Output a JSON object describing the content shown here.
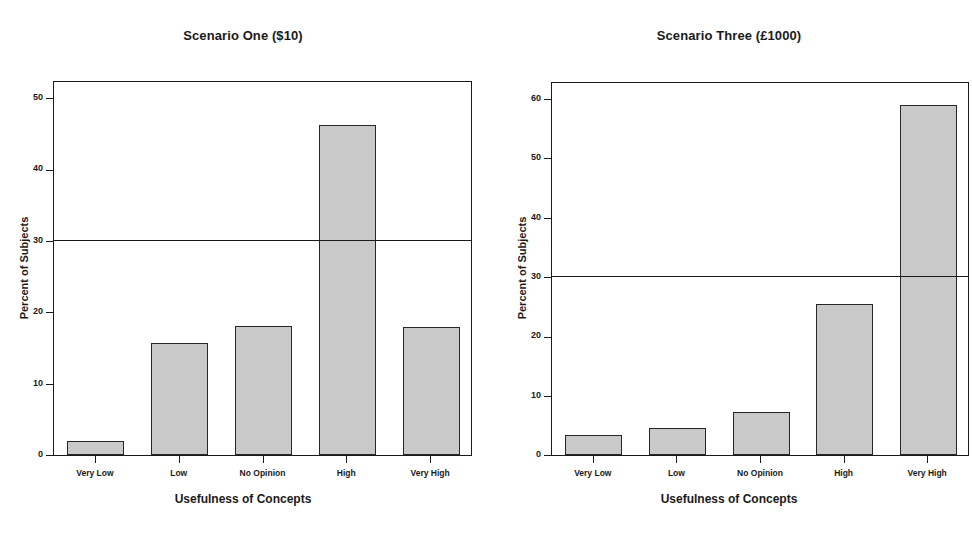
{
  "figure": {
    "background": "#ffffff",
    "bar_fill": "#c9c9c9",
    "bar_edge": "#262626",
    "axis_color": "#1a1a1a"
  },
  "panels": [
    {
      "id": "scenario-one",
      "title": "Scenario One ($10)",
      "xlabel": "Usefulness of Concepts",
      "ylabel": "Percent of Subjects"
    },
    {
      "id": "scenario-three",
      "title": "Scenario Three (£1000)",
      "xlabel": "Usefulness of Concepts",
      "ylabel": "Percent of Subjects"
    }
  ],
  "chart_data": [
    {
      "type": "bar",
      "title": "Scenario One ($10)",
      "xlabel": "Usefulness of Concepts",
      "ylabel": "Percent of Subjects",
      "categories": [
        "Very Low",
        "Low",
        "No Opinion",
        "High",
        "Very High"
      ],
      "values": [
        2.0,
        15.7,
        18.0,
        46.2,
        17.9
      ],
      "ylim": [
        0,
        52.5
      ],
      "yticks": [
        0,
        10,
        20,
        30,
        40,
        50
      ],
      "ytick_labels": [
        "0",
        "10",
        "20",
        "30",
        "40",
        "50"
      ],
      "grid": false,
      "legend": "none",
      "annotations": [
        {
          "kind": "horizontal-reference-line",
          "value": 30
        }
      ]
    },
    {
      "type": "bar",
      "title": "Scenario Three (£1000)",
      "xlabel": "Usefulness of Concepts",
      "ylabel": "Percent of Subjects",
      "categories": [
        "Very Low",
        "Low",
        "No Opinion",
        "High",
        "Very High"
      ],
      "values": [
        3.3,
        4.6,
        7.3,
        25.5,
        59.0
      ],
      "ylim": [
        0,
        63.0
      ],
      "yticks": [
        0,
        10,
        20,
        30,
        40,
        50,
        60
      ],
      "ytick_labels": [
        "0",
        "10",
        "20",
        "30",
        "40",
        "50",
        "60"
      ],
      "grid": false,
      "legend": "none",
      "annotations": [
        {
          "kind": "horizontal-reference-line",
          "value": 30
        }
      ]
    }
  ]
}
